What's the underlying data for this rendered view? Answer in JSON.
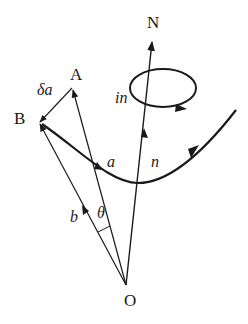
{
  "diagram": {
    "type": "vector-geometry",
    "colors": {
      "stroke": "#1a1a1a",
      "background": "#ffffff"
    },
    "points": {
      "O": {
        "label": "O",
        "x": 126,
        "y": 285
      },
      "N": {
        "label": "N",
        "x": 152,
        "y": 40
      },
      "A": {
        "label": "A",
        "x": 72,
        "y": 88
      },
      "B": {
        "label": "B",
        "x": 38,
        "y": 123
      }
    },
    "labels": {
      "O": "O",
      "N": "N",
      "A": "A",
      "B": "B",
      "delta_a": "δa",
      "a": "a",
      "b": "b",
      "n": "n",
      "theta": "θ",
      "loop": "in"
    },
    "vectors": [
      {
        "name": "n",
        "from": "O",
        "to": "N"
      },
      {
        "name": "a",
        "from": "O",
        "to": "A"
      },
      {
        "name": "b",
        "from": "O",
        "to": "B"
      },
      {
        "name": "delta_a",
        "from": "A",
        "to": "B"
      }
    ],
    "curves": [
      {
        "name": "path-curve",
        "direction": "left-to-right",
        "arrowheads": 2
      },
      {
        "name": "loop",
        "shape": "ellipse",
        "label": "in",
        "circulation": "clockwise-front"
      }
    ],
    "angle": {
      "symbol": "θ",
      "between": [
        "a",
        "b"
      ]
    }
  }
}
